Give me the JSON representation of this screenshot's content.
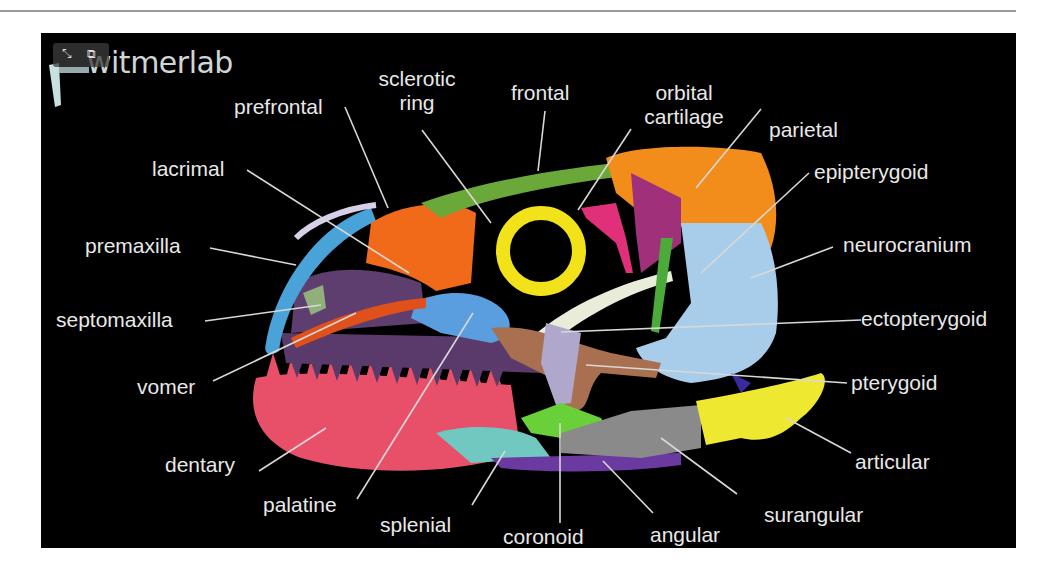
{
  "figure": {
    "logo_text": "witmerlab",
    "overlay_icons": [
      "expand-icon",
      "picture-in-picture-icon"
    ],
    "background": "#000000",
    "label_color": "#e8e8e8"
  },
  "labels": {
    "prefrontal": "prefrontal",
    "sclerotic_ring_1": "sclerotic",
    "sclerotic_ring_2": "ring",
    "frontal": "frontal",
    "orbital_cartilage_1": "orbital",
    "orbital_cartilage_2": "cartilage",
    "parietal": "parietal",
    "lacrimal": "lacrimal",
    "epipterygoid": "epipterygoid",
    "premaxilla": "premaxilla",
    "neurocranium": "neurocranium",
    "septomaxilla": "septomaxilla",
    "ectopterygoid": "ectopterygoid",
    "vomer": "vomer",
    "pterygoid": "pterygoid",
    "dentary": "dentary",
    "articular": "articular",
    "palatine": "palatine",
    "surangular": "surangular",
    "splenial": "splenial",
    "coronoid": "coronoid",
    "angular": "angular"
  },
  "bone_colors": {
    "premaxilla": "#4aa3d8",
    "prefrontal": "#f06a1a",
    "frontal": "#6aa83a",
    "sclerotic_ring": "#f2e21a",
    "orbital_cartilage": "#e0307a",
    "parietal": "#f28c1a",
    "neurocranium": "#a8cdeb",
    "epipterygoid": "#4caa3a",
    "lacrimal": "#6a4a7a",
    "septomaxilla": "#8fb07a",
    "vomer": "#e0501a",
    "palatine": "#5a9ee0",
    "ectopterygoid": "#b0a8cc",
    "pterygoid": "#a87050",
    "dentary": "#e8506a",
    "splenial": "#70c8c0",
    "coronoid": "#6ad03a",
    "angular": "#6a3aa0",
    "surangular": "#8a8a8a",
    "articular": "#eee830"
  }
}
